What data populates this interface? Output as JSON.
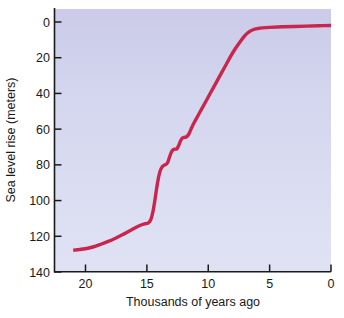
{
  "figure": {
    "kind": "scientific-line-chart",
    "background_color": "#ffffff",
    "plot_fill_top": "#cdcdea",
    "plot_fill_bottom": "#dee0f2",
    "axis_color": "#1a1a1a",
    "curve_color": "#c8264c"
  },
  "chart_data": {
    "type": "line",
    "title": "",
    "xlabel": "Thousands of years ago",
    "ylabel": "Sea level rise (meters)",
    "xlim": [
      21,
      0
    ],
    "ylim": [
      140,
      0
    ],
    "x_inverted": true,
    "y_inverted": true,
    "grid": false,
    "legend": "none",
    "xticks": [
      20,
      15,
      10,
      5,
      0
    ],
    "xticklabels": [
      "20",
      "15",
      "10",
      "5",
      "0"
    ],
    "yticks": [
      0,
      20,
      40,
      60,
      80,
      100,
      120,
      140
    ],
    "yticklabels": [
      "0",
      "20",
      "40",
      "60",
      "80",
      "100",
      "120",
      "140"
    ],
    "series": [
      {
        "name": "Sea level rise",
        "style": "solid",
        "color": "#c8264c",
        "linewidth": 3.4,
        "x": [
          20.6,
          20.0,
          19.4,
          18.8,
          18.2,
          17.6,
          17.0,
          16.5,
          16.1,
          15.7,
          15.35,
          15.1,
          14.9,
          14.7,
          14.5,
          14.35,
          14.2,
          14.05,
          13.9,
          13.75,
          13.6,
          13.45,
          13.3,
          13.15,
          13.0,
          12.85,
          12.7,
          12.55,
          12.4,
          12.25,
          12.1,
          11.95,
          11.8,
          11.6,
          11.4,
          11.2,
          11.0,
          10.6,
          10.2,
          9.8,
          9.4,
          9.0,
          8.6,
          8.2,
          7.8,
          7.4,
          7.0,
          6.8,
          6.6,
          6.4,
          6.2,
          6.0,
          5.6,
          5.0,
          4.0,
          3.0,
          2.0,
          1.0,
          0.0
        ],
        "y": [
          127.5,
          127.0,
          126.0,
          124.6,
          123.0,
          121.2,
          119.2,
          117.3,
          115.8,
          114.4,
          113.4,
          112.9,
          112.6,
          111.0,
          106.0,
          100.0,
          93.0,
          87.0,
          83.0,
          81.0,
          80.2,
          79.8,
          78.5,
          75.5,
          72.8,
          71.5,
          71.2,
          71.0,
          69.0,
          66.5,
          65.0,
          64.6,
          64.4,
          63.0,
          60.0,
          57.0,
          54.5,
          49.5,
          44.5,
          39.5,
          34.5,
          29.5,
          24.5,
          19.5,
          15.0,
          11.0,
          7.5,
          6.2,
          5.2,
          4.5,
          4.0,
          3.7,
          3.3,
          3.0,
          2.7,
          2.5,
          2.3,
          2.1,
          2.0
        ],
        "annotations": [
          {
            "label": "meltwater-pulse-1a",
            "x_range": [
              14.5,
              13.4
            ],
            "y_range": [
              106,
              80
            ]
          },
          {
            "label": "plateau-1",
            "x_range": [
              13.6,
              13.3
            ],
            "y_approx": 80
          },
          {
            "label": "plateau-2",
            "x_range": [
              12.85,
              12.55
            ],
            "y_approx": 71
          },
          {
            "label": "plateau-3",
            "x_range": [
              12.1,
              11.8
            ],
            "y_approx": 64.5
          }
        ]
      },
      {
        "name": "Sea level rise (inferred)",
        "style": "dashed",
        "color": "#c8264c",
        "linewidth": 3.4,
        "x": [
          21.0,
          20.6
        ],
        "y": [
          127.8,
          127.5
        ]
      }
    ]
  },
  "axes": {
    "x_axis_title": "Thousands of years ago",
    "y_axis_title": "Sea level rise (meters)",
    "x_tick_values": [
      "20",
      "15",
      "10",
      "5",
      "0"
    ],
    "y_tick_values": [
      "0",
      "20",
      "40",
      "60",
      "80",
      "100",
      "120",
      "140"
    ]
  }
}
